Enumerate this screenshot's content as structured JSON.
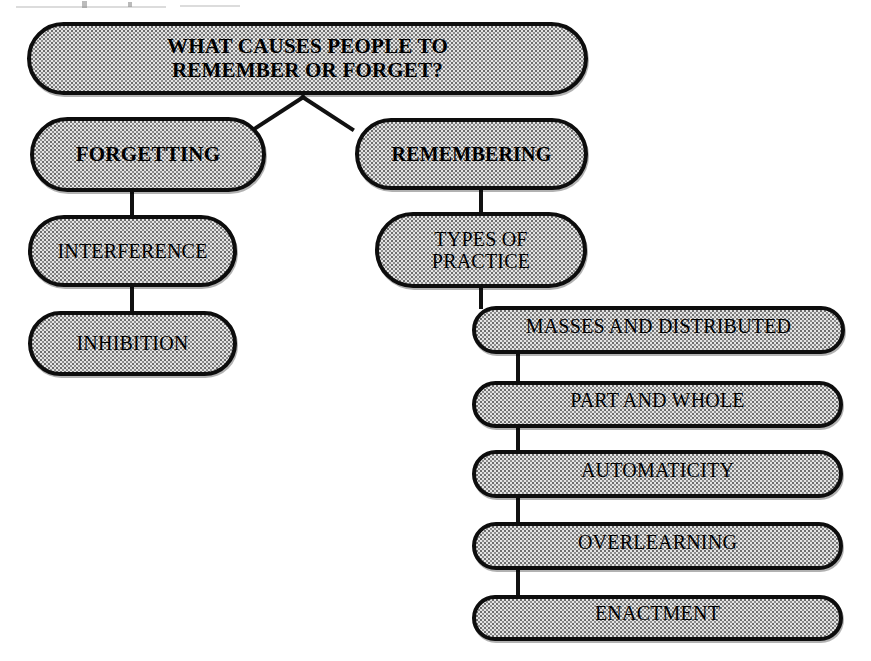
{
  "diagram": {
    "title": "What Causes People to Remember or Forget?",
    "type": "hierarchical-flowchart",
    "style": {
      "box_fill": "#e4e4e4",
      "box_border": "#0d0d0d",
      "text_color": "#000000",
      "connector_color": "#111111",
      "background": "#ffffff"
    },
    "nodes": [
      {
        "id": "root",
        "label": "WHAT CAUSES PEOPLE TO\nREMEMBER OR FORGET?",
        "level": 0,
        "weight": "bold"
      },
      {
        "id": "forgetting",
        "label": "FORGETTING",
        "level": 1,
        "weight": "bold"
      },
      {
        "id": "remembering",
        "label": "REMEMBERING",
        "level": 1,
        "weight": "bold"
      },
      {
        "id": "interference",
        "label": "INTERFERENCE",
        "level": 2,
        "weight": "normal"
      },
      {
        "id": "types-of-practice",
        "label": "TYPES OF\nPRACTICE",
        "level": 2,
        "weight": "normal"
      },
      {
        "id": "inhibition",
        "label": "INHIBITION",
        "level": 3,
        "weight": "normal"
      },
      {
        "id": "masses-and-distributed",
        "label": "MASSES AND DISTRIBUTED",
        "level": 3,
        "weight": "normal"
      },
      {
        "id": "part-and-whole",
        "label": "PART AND WHOLE",
        "level": 4,
        "weight": "normal"
      },
      {
        "id": "automaticity",
        "label": "AUTOMATICITY",
        "level": 5,
        "weight": "normal"
      },
      {
        "id": "overlearning",
        "label": "OVERLEARNING",
        "level": 6,
        "weight": "normal"
      },
      {
        "id": "enactment",
        "label": "ENACTMENT",
        "level": 7,
        "weight": "normal"
      }
    ],
    "edges": [
      {
        "from": "root",
        "to": "forgetting"
      },
      {
        "from": "root",
        "to": "remembering"
      },
      {
        "from": "forgetting",
        "to": "interference"
      },
      {
        "from": "interference",
        "to": "inhibition"
      },
      {
        "from": "remembering",
        "to": "types-of-practice"
      },
      {
        "from": "types-of-practice",
        "to": "masses-and-distributed"
      },
      {
        "from": "masses-and-distributed",
        "to": "part-and-whole"
      },
      {
        "from": "part-and-whole",
        "to": "automaticity"
      },
      {
        "from": "automaticity",
        "to": "overlearning"
      },
      {
        "from": "overlearning",
        "to": "enactment"
      }
    ]
  }
}
